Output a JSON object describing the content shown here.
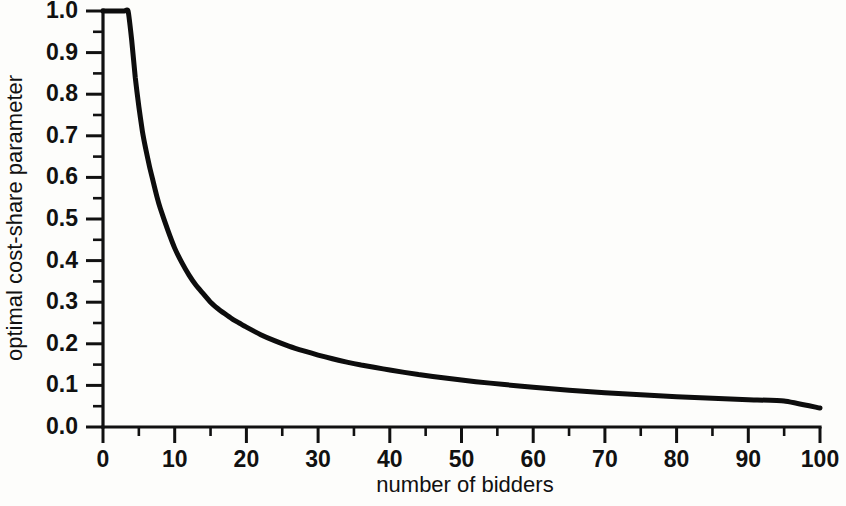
{
  "chart_data": {
    "type": "line",
    "title": "",
    "xlabel": "number of bidders",
    "ylabel": "optimal cost-share parameter",
    "xlim": [
      0,
      100
    ],
    "ylim": [
      0.0,
      1.0
    ],
    "grid": false,
    "legend": null,
    "x_ticks": [
      0,
      10,
      20,
      30,
      40,
      50,
      60,
      70,
      80,
      90,
      100
    ],
    "x_tick_labels": [
      "0",
      "10",
      "20",
      "30",
      "40",
      "50",
      "60",
      "70",
      "80",
      "90",
      "100"
    ],
    "x_minor_ticks": [
      5,
      15,
      25,
      35,
      45,
      55,
      65,
      75,
      85,
      95
    ],
    "y_ticks": [
      0.0,
      0.1,
      0.2,
      0.3,
      0.4,
      0.5,
      0.6,
      0.7,
      0.8,
      0.9,
      1.0
    ],
    "y_tick_labels": [
      "0.0",
      "0.1",
      "0.2",
      "0.3",
      "0.4",
      "0.5",
      "0.6",
      "0.7",
      "0.8",
      "0.9",
      "1.0"
    ],
    "y_minor_ticks": [
      0.05,
      0.15,
      0.25,
      0.35,
      0.45,
      0.55,
      0.65,
      0.75,
      0.85,
      0.95
    ],
    "series": [
      {
        "name": "optimal cost-share parameter",
        "color": "#0d0d0d",
        "x": [
          0,
          1,
          2,
          3,
          3.5,
          4,
          4.5,
          5,
          5.5,
          6,
          6.5,
          7,
          7.5,
          8,
          9,
          10,
          11,
          12,
          13,
          14,
          15,
          16,
          17,
          18,
          19,
          20,
          22,
          24,
          26,
          28,
          30,
          32,
          34,
          36,
          38,
          40,
          44,
          48,
          52,
          56,
          60,
          65,
          70,
          75,
          80,
          85,
          90,
          95,
          100
        ],
        "values": [
          1.0,
          1.0,
          1.0,
          1.0,
          1.0,
          0.93,
          0.84,
          0.77,
          0.71,
          0.665,
          0.625,
          0.59,
          0.555,
          0.525,
          0.475,
          0.43,
          0.395,
          0.365,
          0.34,
          0.32,
          0.3,
          0.285,
          0.272,
          0.26,
          0.25,
          0.24,
          0.222,
          0.207,
          0.194,
          0.183,
          0.173,
          0.164,
          0.156,
          0.149,
          0.143,
          0.137,
          0.126,
          0.117,
          0.109,
          0.102,
          0.0955,
          0.0885,
          0.0825,
          0.0775,
          0.073,
          0.069,
          0.0655,
          0.0625,
          0.0455
        ]
      }
    ],
    "annotations": []
  },
  "axis": {
    "x_title": "number of bidders",
    "y_title": "optimal cost-share parameter"
  }
}
